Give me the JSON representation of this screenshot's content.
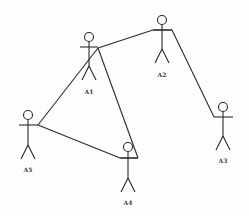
{
  "diagram": {
    "type": "use-case-actors-network",
    "stroke_color": "#2a2a2a",
    "actors": [
      {
        "id": "A1",
        "label": "A1",
        "x": 89,
        "y": 37
      },
      {
        "id": "A2",
        "label": "A2",
        "x": 162,
        "y": 20
      },
      {
        "id": "A3",
        "label": "A3",
        "x": 223,
        "y": 107
      },
      {
        "id": "A4",
        "label": "A4",
        "x": 128,
        "y": 147
      },
      {
        "id": "A5",
        "label": "A5",
        "x": 28,
        "y": 115
      }
    ],
    "connections": [
      {
        "from": "A1",
        "to": "A2"
      },
      {
        "from": "A2",
        "to": "A3"
      },
      {
        "from": "A1",
        "to": "A5"
      },
      {
        "from": "A1",
        "to": "A4"
      },
      {
        "from": "A5",
        "to": "A4"
      }
    ]
  }
}
